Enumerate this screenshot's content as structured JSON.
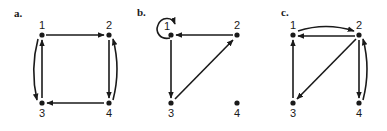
{
  "panels": [
    {
      "id": "a",
      "label": "a.",
      "nodes": [
        {
          "id": "1",
          "label": "1"
        },
        {
          "id": "2",
          "label": "2"
        },
        {
          "id": "3",
          "label": "3"
        },
        {
          "id": "4",
          "label": "4"
        }
      ],
      "edges": [
        {
          "from": "1",
          "to": "2"
        },
        {
          "from": "2",
          "to": "4"
        },
        {
          "from": "4",
          "to": "2"
        },
        {
          "from": "4",
          "to": "3"
        },
        {
          "from": "3",
          "to": "1"
        },
        {
          "from": "1",
          "to": "3"
        }
      ]
    },
    {
      "id": "b",
      "label": "b.",
      "nodes": [
        {
          "id": "1",
          "label": "1"
        },
        {
          "id": "2",
          "label": "2"
        },
        {
          "id": "3",
          "label": "3"
        },
        {
          "id": "4",
          "label": "4"
        }
      ],
      "edges": [
        {
          "from": "1",
          "to": "1"
        },
        {
          "from": "2",
          "to": "1"
        },
        {
          "from": "1",
          "to": "3"
        },
        {
          "from": "3",
          "to": "2"
        }
      ]
    },
    {
      "id": "c",
      "label": "c.",
      "nodes": [
        {
          "id": "1",
          "label": "1"
        },
        {
          "id": "2",
          "label": "2"
        },
        {
          "id": "3",
          "label": "3"
        },
        {
          "id": "4",
          "label": "4"
        }
      ],
      "edges": [
        {
          "from": "1",
          "to": "2"
        },
        {
          "from": "2",
          "to": "1"
        },
        {
          "from": "2",
          "to": "3"
        },
        {
          "from": "3",
          "to": "1"
        },
        {
          "from": "2",
          "to": "4"
        },
        {
          "from": "4",
          "to": "2"
        }
      ]
    }
  ]
}
